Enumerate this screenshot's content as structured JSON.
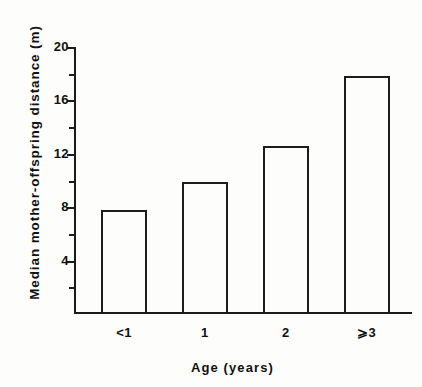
{
  "chart_data": {
    "type": "bar",
    "title": "",
    "xlabel": "Age  (years)",
    "ylabel": "Median  mother-offspring  distance (m)",
    "categories": [
      "<1",
      "1",
      "2",
      "⩾3"
    ],
    "values": [
      7.8,
      9.9,
      12.6,
      17.8
    ],
    "ylim": [
      0,
      20
    ],
    "xlim": [
      0,
      4
    ],
    "y_major_ticks": [
      4,
      8,
      12,
      16,
      20
    ],
    "y_major_tick_labels": [
      "4",
      "8",
      "12",
      "16",
      "20"
    ],
    "y_minor_ticks": [
      2,
      6,
      10,
      14,
      18
    ],
    "grid": false,
    "legend": false,
    "legend_position": "none",
    "bar_fill": "none",
    "bar_edge_color": "#1c1c1c",
    "background_color": "#fdfdfc",
    "series": [
      {
        "name": "Median mother-offspring distance",
        "values": [
          7.8,
          9.9,
          12.6,
          17.8
        ]
      }
    ]
  }
}
